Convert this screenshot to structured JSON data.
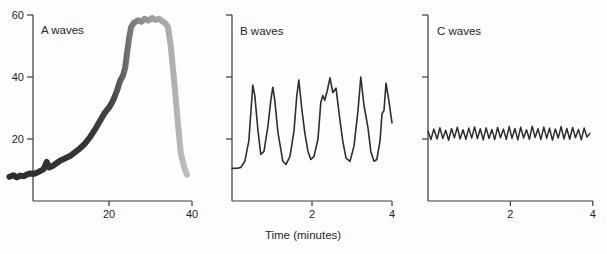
{
  "figure": {
    "background": "#fdfdfd",
    "axis_color": "#3a3a3a",
    "text_color": "#262626",
    "xaxis_title": "Time (minutes)"
  },
  "chart_data": [
    {
      "type": "line",
      "title": "A waves",
      "xlabel": "Time (minutes)",
      "xlim": [
        0,
        40
      ],
      "ylim": [
        0,
        60
      ],
      "xticks": [
        20,
        40
      ],
      "yticks": [
        20,
        40,
        60
      ],
      "ytick_labels_visible": true,
      "line_style": {
        "width": 6,
        "gradient": [
          [
            0,
            "#2d2d2d"
          ],
          [
            0.45,
            "#363636"
          ],
          [
            0.58,
            "#484848"
          ],
          [
            0.68,
            "#7a7a7a"
          ],
          [
            0.76,
            "#959595"
          ],
          [
            0.86,
            "#a7a9a9"
          ],
          [
            1,
            "#babebe"
          ]
        ]
      },
      "series": [
        {
          "name": "A-wave ICP trace (plateau wave)",
          "points": [
            [
              -4,
              7.8
            ],
            [
              -3,
              8.3
            ],
            [
              -2.2,
              7.6
            ],
            [
              -1.4,
              8.2
            ],
            [
              -0.5,
              8.0
            ],
            [
              0.3,
              8.6
            ],
            [
              1.0,
              8.9
            ],
            [
              2.0,
              8.8
            ],
            [
              3.0,
              9.4
            ],
            [
              4.2,
              10.2
            ],
            [
              5.0,
              12.6
            ],
            [
              5.6,
              10.8
            ],
            [
              6.5,
              11.4
            ],
            [
              8.2,
              13.0
            ],
            [
              10.6,
              14.5
            ],
            [
              13.0,
              17.0
            ],
            [
              14.2,
              18.5
            ],
            [
              15.4,
              20.5
            ],
            [
              16.6,
              23.0
            ],
            [
              17.8,
              25.8
            ],
            [
              19.0,
              28.5
            ],
            [
              20.2,
              30.5
            ],
            [
              21.0,
              32.5
            ],
            [
              21.9,
              35.5
            ],
            [
              22.7,
              38.8
            ],
            [
              23.4,
              40.5
            ],
            [
              23.9,
              43.0
            ],
            [
              24.3,
              47.0
            ],
            [
              24.8,
              52.0
            ],
            [
              25.3,
              56.0
            ],
            [
              26.0,
              57.5
            ],
            [
              27.0,
              58.3
            ],
            [
              27.8,
              57.8
            ],
            [
              28.6,
              58.8
            ],
            [
              29.5,
              58.2
            ],
            [
              30.4,
              59.0
            ],
            [
              31.2,
              58.4
            ],
            [
              32.0,
              58.8
            ],
            [
              32.8,
              58.0
            ],
            [
              33.4,
              57.6
            ],
            [
              34.2,
              56.2
            ],
            [
              34.9,
              50.0
            ],
            [
              35.4,
              43.0
            ],
            [
              35.9,
              36.0
            ],
            [
              36.4,
              28.0
            ],
            [
              36.9,
              21.0
            ],
            [
              37.3,
              15.5
            ],
            [
              38.1,
              11.0
            ],
            [
              38.8,
              8.5
            ]
          ]
        }
      ]
    },
    {
      "type": "line",
      "title": "B waves",
      "xlabel": "Time (minutes)",
      "xlim": [
        0,
        4
      ],
      "ylim": [
        0,
        60
      ],
      "xticks": [
        2,
        4
      ],
      "yticks": [
        20,
        40,
        60
      ],
      "ytick_labels_visible": false,
      "line_style": {
        "width": 1.6,
        "color": "#2e2e2e"
      },
      "series": [
        {
          "name": "B-wave ICP trace",
          "points": [
            [
              0,
              10.5
            ],
            [
              0.15,
              10.6
            ],
            [
              0.22,
              10.8
            ],
            [
              0.32,
              12.8
            ],
            [
              0.42,
              19.3
            ],
            [
              0.52,
              37.4
            ],
            [
              0.57,
              34.0
            ],
            [
              0.65,
              22.6
            ],
            [
              0.72,
              15.0
            ],
            [
              0.8,
              16.0
            ],
            [
              0.9,
              24.3
            ],
            [
              0.97,
              32.5
            ],
            [
              1.02,
              36.7
            ],
            [
              1.07,
              32.5
            ],
            [
              1.15,
              22.0
            ],
            [
              1.22,
              16.7
            ],
            [
              1.27,
              12.8
            ],
            [
              1.35,
              11.8
            ],
            [
              1.45,
              14.4
            ],
            [
              1.55,
              22.6
            ],
            [
              1.62,
              34.0
            ],
            [
              1.67,
              39.0
            ],
            [
              1.75,
              29.2
            ],
            [
              1.82,
              22.0
            ],
            [
              1.9,
              16.0
            ],
            [
              1.97,
              13.4
            ],
            [
              2.05,
              14.4
            ],
            [
              2.15,
              20.0
            ],
            [
              2.22,
              31.8
            ],
            [
              2.27,
              34.0
            ],
            [
              2.32,
              32.5
            ],
            [
              2.38,
              35.5
            ],
            [
              2.45,
              39.7
            ],
            [
              2.52,
              35.0
            ],
            [
              2.6,
              36.4
            ],
            [
              2.7,
              25.9
            ],
            [
              2.77,
              19.3
            ],
            [
              2.85,
              13.8
            ],
            [
              2.95,
              12.8
            ],
            [
              3.05,
              17.7
            ],
            [
              3.15,
              29.2
            ],
            [
              3.22,
              40.0
            ],
            [
              3.3,
              30.8
            ],
            [
              3.4,
              23.6
            ],
            [
              3.47,
              16.0
            ],
            [
              3.55,
              12.8
            ],
            [
              3.62,
              13.4
            ],
            [
              3.7,
              19.3
            ],
            [
              3.75,
              28.2
            ],
            [
              3.8,
              29.2
            ],
            [
              3.85,
              38.0
            ],
            [
              3.92,
              32.5
            ],
            [
              4.0,
              25.2
            ]
          ]
        }
      ]
    },
    {
      "type": "line",
      "title": "C waves",
      "xlabel": "Time (minutes)",
      "xlim": [
        0,
        4
      ],
      "ylim": [
        0,
        60
      ],
      "xticks": [
        2,
        4
      ],
      "yticks": [
        20,
        40,
        60
      ],
      "ytick_labels_visible": false,
      "line_style": {
        "width": 1.5,
        "color": "#2e2e2e"
      },
      "series": [
        {
          "name": "C-wave ICP trace",
          "points": [
            [
              0,
              22.5
            ],
            [
              0.07,
              19.8
            ],
            [
              0.14,
              23.2
            ],
            [
              0.22,
              20.0
            ],
            [
              0.29,
              23.6
            ],
            [
              0.36,
              20.2
            ],
            [
              0.43,
              22.8
            ],
            [
              0.5,
              19.6
            ],
            [
              0.57,
              23.4
            ],
            [
              0.64,
              20.4
            ],
            [
              0.71,
              23.8
            ],
            [
              0.78,
              20.0
            ],
            [
              0.85,
              23.0
            ],
            [
              0.92,
              19.9
            ],
            [
              0.99,
              23.5
            ],
            [
              1.06,
              20.3
            ],
            [
              1.13,
              23.9
            ],
            [
              1.2,
              20.1
            ],
            [
              1.27,
              23.3
            ],
            [
              1.34,
              19.7
            ],
            [
              1.41,
              23.6
            ],
            [
              1.48,
              20.2
            ],
            [
              1.55,
              23.1
            ],
            [
              1.62,
              19.8
            ],
            [
              1.69,
              23.7
            ],
            [
              1.76,
              20.4
            ],
            [
              1.83,
              23.2
            ],
            [
              1.9,
              19.9
            ],
            [
              1.97,
              24.0
            ],
            [
              2.04,
              20.2
            ],
            [
              2.11,
              23.4
            ],
            [
              2.18,
              19.7
            ],
            [
              2.25,
              23.8
            ],
            [
              2.32,
              20.3
            ],
            [
              2.39,
              23.0
            ],
            [
              2.46,
              19.9
            ],
            [
              2.53,
              24.1
            ],
            [
              2.6,
              20.5
            ],
            [
              2.67,
              23.3
            ],
            [
              2.74,
              19.8
            ],
            [
              2.81,
              23.9
            ],
            [
              2.88,
              20.2
            ],
            [
              2.95,
              23.5
            ],
            [
              3.02,
              19.6
            ],
            [
              3.09,
              23.2
            ],
            [
              3.16,
              20.3
            ],
            [
              3.23,
              24.0
            ],
            [
              3.3,
              20.0
            ],
            [
              3.37,
              23.4
            ],
            [
              3.44,
              19.9
            ],
            [
              3.51,
              23.7
            ],
            [
              3.58,
              20.4
            ],
            [
              3.65,
              23.1
            ],
            [
              3.72,
              19.7
            ],
            [
              3.79,
              23.5
            ],
            [
              3.86,
              20.6
            ],
            [
              3.93,
              21.8
            ]
          ]
        }
      ]
    }
  ]
}
